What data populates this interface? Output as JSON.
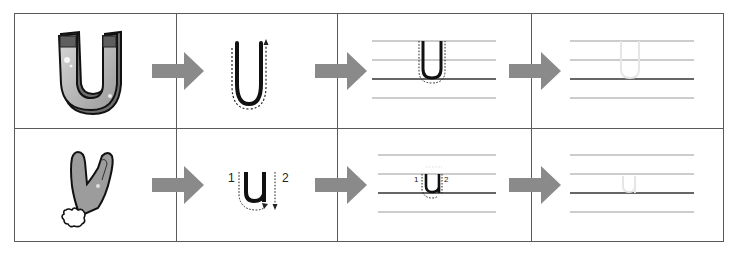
{
  "worksheet": {
    "title": "Letter U writing practice",
    "rows": [
      {
        "picture": "magnet",
        "letter_case": "uppercase",
        "letter": "U",
        "stroke_numbers": [],
        "steps": [
          "picture",
          "trace-with-arrow",
          "trace-on-lines",
          "write-on-lines"
        ]
      },
      {
        "picture": "glove",
        "letter_case": "lowercase",
        "letter": "u",
        "stroke_numbers": [
          "1",
          "2"
        ],
        "steps": [
          "picture",
          "trace-with-arrow",
          "trace-on-lines",
          "write-on-lines"
        ]
      }
    ],
    "colors": {
      "grid": "#5a5a5a",
      "arrow": "#8a8a8a",
      "letter": "#111111",
      "ghost_letter": "#e6e6e6",
      "guide_line": "#9a9a9a",
      "baseline": "#333333"
    }
  },
  "labels": {
    "upper_letter": "U",
    "lower_letter": "u",
    "stroke_1": "1",
    "stroke_2": "2"
  }
}
